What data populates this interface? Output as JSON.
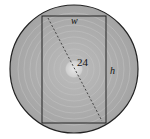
{
  "diagram": {
    "circle": {
      "cx": 74,
      "cy": 69,
      "r": 64,
      "fill": "#a9a9a9",
      "stroke": "#222222"
    },
    "rectangle": {
      "x": 42,
      "y": 16,
      "width": 64,
      "height": 107,
      "stroke": "#222222"
    },
    "diagonal": {
      "x1": 48,
      "y1": 18,
      "x2": 102,
      "y2": 121,
      "style": "dashed"
    },
    "labels": {
      "width": "w",
      "height": "h",
      "diameter": "24"
    }
  }
}
